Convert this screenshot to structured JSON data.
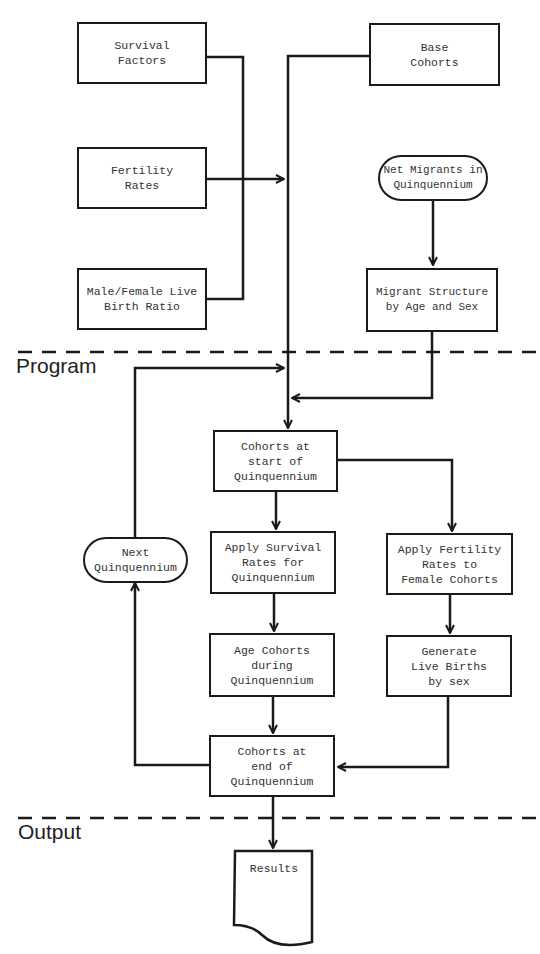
{
  "sections": {
    "program": "Program",
    "output": "Output"
  },
  "inputs": {
    "survival_factors": "Survival\nFactors",
    "fertility_rates": "Fertility\nRates",
    "birth_ratio": "Male/Female Live\nBirth  Ratio",
    "base_cohorts": "Base\nCohorts",
    "net_migrants": "Net Migrants in\nQuinquennium",
    "migrant_structure": "Migrant Structure\nby Age and Sex"
  },
  "program": {
    "cohorts_start": "Cohorts at\nstart of\nQuinquennium",
    "next_quinquennium": "Next\nQuinquennium",
    "apply_survival": "Apply Survival\nRates  for\nQuinquennium",
    "apply_fertility": "Apply  Fertility\nRates to\nFemale Cohorts",
    "age_cohorts": "Age  Cohorts\nduring\nQuinquennium",
    "generate_births": "Generate\nLive Births\nby sex",
    "cohorts_end": "Cohorts at\nend of\nQuinquennium"
  },
  "output": {
    "results": "Results"
  }
}
